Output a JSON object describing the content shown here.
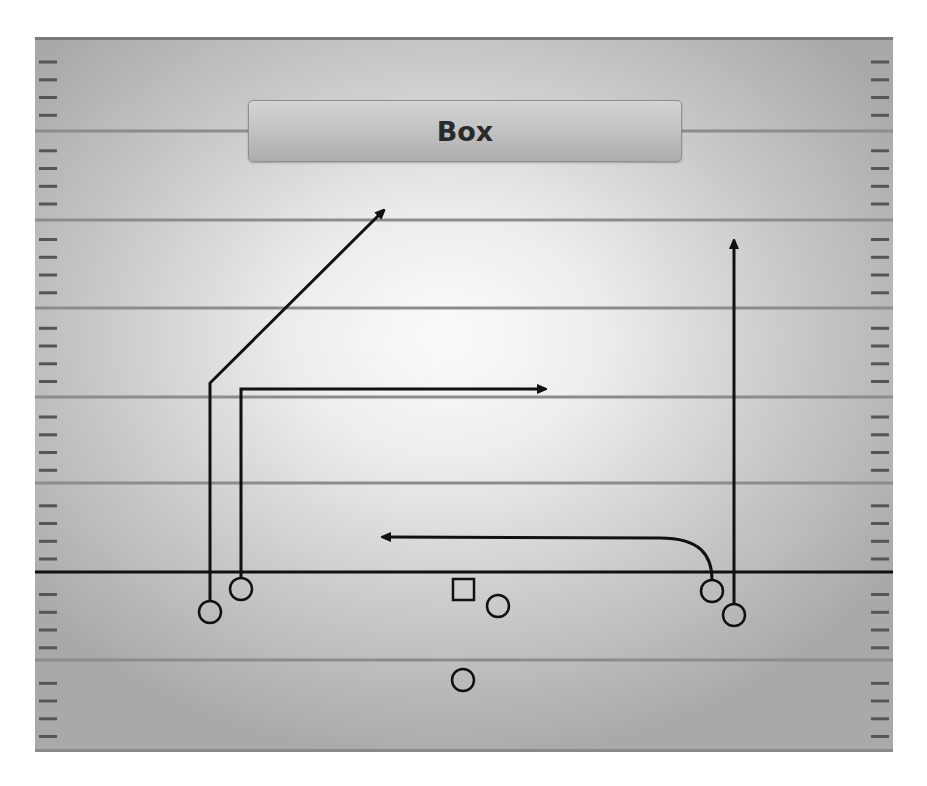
{
  "play": {
    "title": "Box"
  },
  "colors": {
    "ink": "#111111",
    "yard_line": "#8c8c8c",
    "hash": "#555555",
    "line_of_scrimmage": "#111111"
  },
  "field": {
    "left": 35,
    "right": 893,
    "top": 37,
    "bottom": 752,
    "yard_lines_y": [
      131,
      220,
      308,
      397,
      483,
      660
    ],
    "line_of_scrimmage_y": 572,
    "hash_start_y": 62,
    "hash_spacing": 17.75,
    "hash_length": 18
  },
  "players": [
    {
      "id": "left-wide-receiver",
      "shape": "circle",
      "x": 210,
      "y": 612
    },
    {
      "id": "left-slot-receiver",
      "shape": "circle",
      "x": 241,
      "y": 589
    },
    {
      "id": "center",
      "shape": "square",
      "x": 463,
      "y": 590
    },
    {
      "id": "quarterback",
      "shape": "circle",
      "x": 498,
      "y": 606
    },
    {
      "id": "running-back",
      "shape": "circle",
      "x": 463,
      "y": 680
    },
    {
      "id": "right-slot-receiver",
      "shape": "circle",
      "x": 712,
      "y": 591
    },
    {
      "id": "right-wide-receiver",
      "shape": "circle",
      "x": 734,
      "y": 615
    }
  ],
  "routes": [
    {
      "id": "route-post",
      "path": "M210 601 L210 383 L380 214"
    },
    {
      "id": "route-out",
      "path": "M241 578 L241 389 L540 389"
    },
    {
      "id": "route-swing",
      "path": "M712 580 C712 555 700 538 660 538 L388 537"
    },
    {
      "id": "route-go",
      "path": "M734 604 L734 246"
    }
  ]
}
